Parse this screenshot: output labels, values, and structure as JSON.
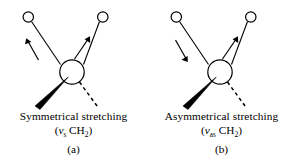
{
  "figure": {
    "background_color": "#ffffff",
    "stroke_color": "#000000"
  },
  "panels": [
    {
      "id": "a",
      "caption_mode": "Symmetrical stretching",
      "mode_symbol_prefix": "(",
      "mode_symbol_nu": "ν",
      "mode_symbol_subscript": "s",
      "mode_formula": "CH",
      "mode_formula_subscript": "2",
      "mode_symbol_suffix": ")",
      "panel_label": "(a)",
      "left_arrow_direction": "up-left",
      "right_arrow_direction": "up-right",
      "atoms": {
        "center_label": "carbon",
        "left_hydrogen_label": "hydrogen",
        "right_hydrogen_label": "hydrogen"
      },
      "bonds": {
        "wedge": "bold-wedge-down-left",
        "dashed": "dashed-down-right"
      }
    },
    {
      "id": "b",
      "caption_mode": "Asymmetrical stretching",
      "mode_symbol_prefix": "(",
      "mode_symbol_nu": "ν",
      "mode_symbol_subscript": "as",
      "mode_formula": "CH",
      "mode_formula_subscript": "2",
      "mode_symbol_suffix": ")",
      "panel_label": "(b)",
      "left_arrow_direction": "down-right",
      "right_arrow_direction": "up-right",
      "atoms": {
        "center_label": "carbon",
        "left_hydrogen_label": "hydrogen",
        "right_hydrogen_label": "hydrogen"
      },
      "bonds": {
        "wedge": "bold-wedge-down-left",
        "dashed": "dashed-down-right"
      }
    }
  ]
}
